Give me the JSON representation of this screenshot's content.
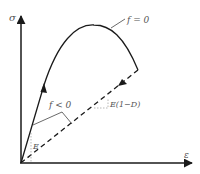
{
  "diagram": {
    "type": "stress-strain damage curve",
    "axes": {
      "y_label": "σ",
      "x_label": "ε"
    },
    "labels": {
      "yield_surface": "f = 0",
      "elastic_region": "f < 0",
      "initial_modulus": "E",
      "damaged_modulus": "E(1−D)"
    },
    "colors": {
      "line": "#1a1a1a",
      "text": "#555555",
      "slope_triangle": "#999999"
    }
  }
}
